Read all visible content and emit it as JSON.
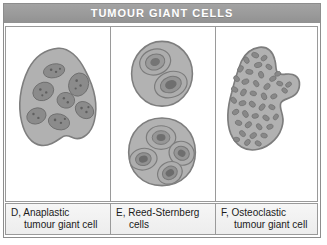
{
  "figure": {
    "title": "TUMOUR GIANT CELLS",
    "header_bg": "#9a9a9a",
    "header_text_color": "#ffffff",
    "caption_bg": "#f1f1f1",
    "border_color": "#9a9a9a",
    "cytoplasm_color": "#b0b0b0",
    "nucleus_color": "#8a8a8a",
    "nucleolus_color": "#6a6a6a"
  },
  "panels": [
    {
      "id": "D",
      "letter": "D,",
      "name": "Anaplastic tumour giant cell",
      "caption_line1": "D, Anaplastic",
      "caption_line2": "tumour giant cell",
      "cell_count": 1,
      "nuclei_count": 8,
      "description": "single large irregular blob-shaped cell with multiple scattered pleomorphic nuclei"
    },
    {
      "id": "E",
      "letter": "E,",
      "name": "Reed-Sternberg cells",
      "caption_line1": "E, Reed-Sternberg",
      "caption_line2": "cells",
      "cell_count": 2,
      "nuclei_count": 6,
      "description": "upper binucleate cell and lower multilobated cell, each nucleus with a prominent nucleolus"
    },
    {
      "id": "F",
      "letter": "F,",
      "name": "Osteoclastic tumour giant cell",
      "caption_line1": "F, Osteoclastic",
      "caption_line2": "tumour giant cell",
      "cell_count": 1,
      "nuclei_count": 42,
      "description": "irregular amoeboid cell packed with many small uniform oval nuclei"
    }
  ]
}
